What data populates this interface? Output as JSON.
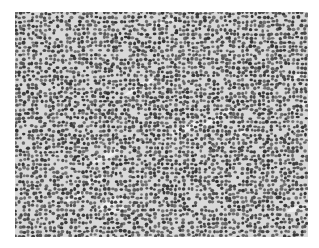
{
  "image": {
    "kind": "grayscale histology micrograph",
    "subject": "densely packed small round cells with scattered pale stromal streaks",
    "background_color": "#ffffff",
    "tissue_base_color": "#d9d9d9",
    "nucleus_color_dark": "#3a3a3a",
    "nucleus_color_light": "#7a7a7a",
    "bounds": {
      "x": 15,
      "y": 12,
      "width": 293,
      "height": 225
    }
  }
}
